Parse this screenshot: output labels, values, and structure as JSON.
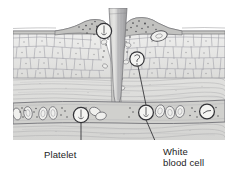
{
  "figure": {
    "background_color": "#ffffff"
  },
  "labels": {
    "platelet": "Platelet",
    "white_blood_cell_line1": "White",
    "white_blood_cell_line2": "blood cell"
  },
  "colors": {
    "ink": "#1c1c1c",
    "line": "#55555a",
    "epidermis_fill": "#e8e8e6",
    "epidermis_cell_stroke": "#8d8d90",
    "dermis_fill": "#dededc",
    "dermis_fiber": "#a6a6a8",
    "vessel_fill": "#d2d2d0",
    "vessel_wall": "#7a7a7e",
    "inflamed_fill": "#c8c8c6",
    "splinter_fill_light": "#d9d9d7",
    "splinter_fill_dark": "#a9a9ab",
    "cell_fill": "#f2f2f0",
    "speckle": "#4a4a4d",
    "leader_line": "#3a3a3d"
  },
  "structures": [
    {
      "name": "splinter",
      "description": "tapered gray splinter entering skin"
    },
    {
      "name": "epidermis",
      "description": "cobblestone cell layer"
    },
    {
      "name": "dermis",
      "description": "wavy collagen fiber layer"
    },
    {
      "name": "blood-vessel",
      "description": "capillary with red blood cells"
    },
    {
      "name": "inflamed-tissue",
      "description": "speckled swollen tissue at wound"
    },
    {
      "name": "platelet-cell",
      "description": "circled platelet in vessel"
    },
    {
      "name": "white-blood-cell",
      "description": "circled white blood cells"
    }
  ]
}
